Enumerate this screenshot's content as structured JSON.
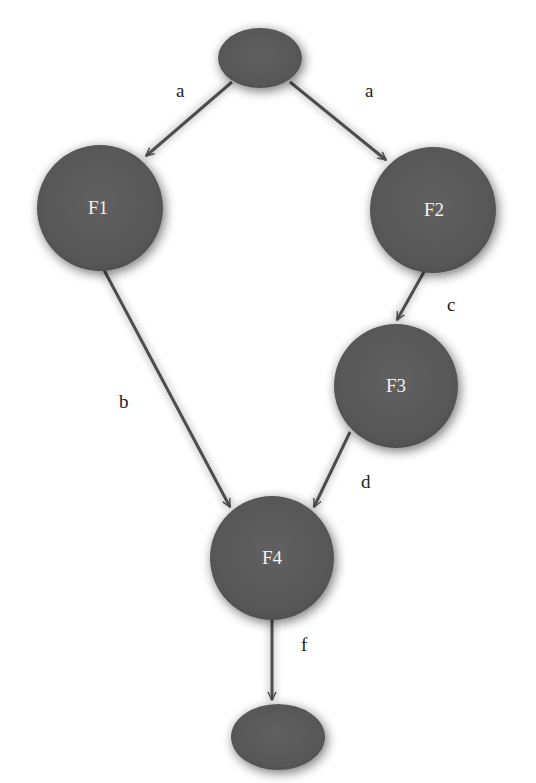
{
  "diagram": {
    "type": "directed-graph",
    "colors": {
      "node_fill": "#5a5a5a",
      "node_edge": "#4a4a4a",
      "node_text": "#f2f2f2",
      "edge": "#4d4d4d",
      "edge_label": "#222222",
      "background": "#ffffff"
    },
    "nodes": [
      {
        "id": "start",
        "label": "",
        "shape": "ellipse",
        "cx": 260,
        "cy": 58,
        "rx": 42,
        "ry": 30
      },
      {
        "id": "F1",
        "label": "F1",
        "shape": "circle",
        "cx": 100,
        "cy": 208,
        "r": 63
      },
      {
        "id": "F2",
        "label": "F2",
        "shape": "circle",
        "cx": 433,
        "cy": 210,
        "r": 63
      },
      {
        "id": "F3",
        "label": "F3",
        "shape": "circle",
        "cx": 396,
        "cy": 386,
        "r": 62
      },
      {
        "id": "F4",
        "label": "F4",
        "shape": "circle",
        "cx": 272,
        "cy": 558,
        "r": 62
      },
      {
        "id": "end",
        "label": "",
        "shape": "ellipse",
        "cx": 278,
        "cy": 737,
        "rx": 47,
        "ry": 33
      }
    ],
    "edges": [
      {
        "from": "start",
        "to": "F1",
        "label": "a",
        "label_x": 176,
        "label_y": 97
      },
      {
        "from": "start",
        "to": "F2",
        "label": "a",
        "label_x": 365,
        "label_y": 97
      },
      {
        "from": "F2",
        "to": "F3",
        "label": "c",
        "label_x": 447,
        "label_y": 311
      },
      {
        "from": "F1",
        "to": "F4",
        "label": "b",
        "label_x": 119,
        "label_y": 408
      },
      {
        "from": "F3",
        "to": "F4",
        "label": "d",
        "label_x": 361,
        "label_y": 488
      },
      {
        "from": "F4",
        "to": "end",
        "label": "f",
        "label_x": 301,
        "label_y": 651
      }
    ]
  }
}
